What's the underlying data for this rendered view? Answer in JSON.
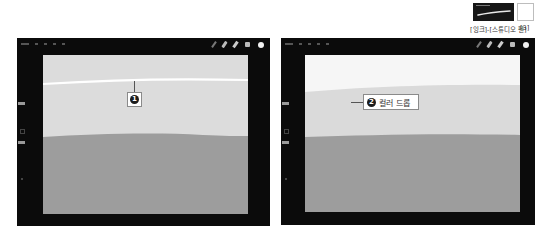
{
  "reference": {
    "brush_caption": "[잉크]-[스튜디오 펜]",
    "swatch_caption": "[3]",
    "swatch_color": "#ffffff"
  },
  "panels": [
    {
      "id": "left",
      "callout": {
        "number": "1",
        "label": ""
      },
      "colors": {
        "top_area": "#dcdcdc",
        "stroke": "#ffffff",
        "bottom_area": "#9d9d9d"
      }
    },
    {
      "id": "right",
      "callout": {
        "number": "2",
        "label": "컬러 드롭"
      },
      "colors": {
        "top_area": "#f6f6f6",
        "middle_area": "#dadada",
        "bottom_area": "#9d9d9d"
      }
    }
  ],
  "toolbar": {
    "tools": [
      "brush-icon",
      "smudge-icon",
      "eraser-icon",
      "layers-icon",
      "color-icon"
    ]
  }
}
